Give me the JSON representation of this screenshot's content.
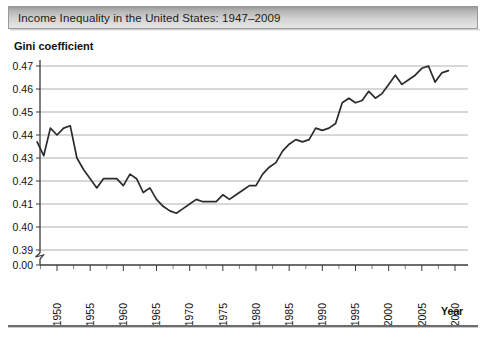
{
  "title_bar": {
    "title": "Income Inequality in the United States: 1947–2009"
  },
  "axis_titles": {
    "y": "Gini coefficient",
    "x": "Year"
  },
  "chart_data": {
    "type": "line",
    "title": "Income Inequality in the United States: 1947–2009",
    "xlabel": "Year",
    "ylabel": "Gini coefficient",
    "xlim": [
      1947,
      2010
    ],
    "ylim": [
      0.386,
      0.4735
    ],
    "grid": true,
    "legend": null,
    "axis_break": {
      "axis": "y",
      "between": [
        0.0,
        0.39
      ],
      "symbol": "zigzag"
    },
    "ytick_labels": [
      "0.00",
      "0.39",
      "0.40",
      "0.41",
      "0.42",
      "0.43",
      "0.44",
      "0.45",
      "0.46",
      "0.47"
    ],
    "ytick_values": [
      0.0,
      0.39,
      0.4,
      0.41,
      0.42,
      0.43,
      0.44,
      0.45,
      0.46,
      0.47
    ],
    "xtick_labels": [
      "1950",
      "1955",
      "1960",
      "1965",
      "1970",
      "1975",
      "1980",
      "1985",
      "1990",
      "1995",
      "2000",
      "2005",
      "2010"
    ],
    "xtick_values": [
      1950,
      1955,
      1960,
      1965,
      1970,
      1975,
      1980,
      1985,
      1990,
      1995,
      2000,
      2005,
      2010
    ],
    "xtick_minor_step": 2.5,
    "x": [
      1947,
      1948,
      1949,
      1950,
      1951,
      1952,
      1953,
      1954,
      1955,
      1956,
      1957,
      1958,
      1959,
      1960,
      1961,
      1962,
      1963,
      1964,
      1965,
      1966,
      1967,
      1968,
      1969,
      1970,
      1971,
      1972,
      1973,
      1974,
      1975,
      1976,
      1977,
      1978,
      1979,
      1980,
      1981,
      1982,
      1983,
      1984,
      1985,
      1986,
      1987,
      1988,
      1989,
      1990,
      1991,
      1992,
      1993,
      1994,
      1995,
      1996,
      1997,
      1998,
      1999,
      2000,
      2001,
      2002,
      2003,
      2004,
      2005,
      2006,
      2007,
      2008,
      2009
    ],
    "values": [
      0.437,
      0.431,
      0.443,
      0.44,
      0.443,
      0.444,
      0.43,
      0.425,
      0.421,
      0.417,
      0.421,
      0.421,
      0.421,
      0.418,
      0.423,
      0.421,
      0.415,
      0.417,
      0.412,
      0.409,
      0.407,
      0.406,
      0.408,
      0.41,
      0.412,
      0.411,
      0.411,
      0.411,
      0.414,
      0.412,
      0.414,
      0.416,
      0.418,
      0.418,
      0.423,
      0.426,
      0.428,
      0.433,
      0.436,
      0.438,
      0.437,
      0.438,
      0.443,
      0.442,
      0.443,
      0.445,
      0.454,
      0.456,
      0.454,
      0.455,
      0.459,
      0.456,
      0.458,
      0.462,
      0.466,
      0.462,
      0.464,
      0.466,
      0.469,
      0.47,
      0.463,
      0.467,
      0.468
    ]
  }
}
